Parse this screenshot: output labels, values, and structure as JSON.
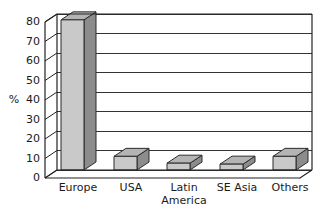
{
  "chart_data": {
    "type": "bar",
    "title": "",
    "subtitle": "",
    "xlabel": "",
    "ylabel": "%",
    "ylim": [
      0,
      80
    ],
    "ytick_step": 10,
    "yticks": [
      0,
      10,
      20,
      30,
      40,
      50,
      60,
      70,
      80
    ],
    "ytick_labels": [
      "0",
      "10",
      "20",
      "30",
      "40",
      "50",
      "60",
      "70",
      "80"
    ],
    "categories": [
      "Europe",
      "USA",
      "Latin America",
      "SE Asia",
      "Others"
    ],
    "category_label_lines": [
      [
        "Europe"
      ],
      [
        "USA"
      ],
      [
        "Latin",
        "America"
      ],
      [
        "SE",
        "Asia"
      ],
      [
        "Others"
      ]
    ],
    "values": [
      77,
      7,
      3.5,
      3,
      7
    ],
    "grid": true,
    "grid_axis": "y",
    "legend": false,
    "legend_position": "none",
    "style": "3d-column",
    "annotations": []
  },
  "colors": {
    "bar_front": "#c9c9c9",
    "bar_top": "#b4b4b4",
    "bar_side": "#8c8c8c",
    "bar_outline": "#2b2b2b",
    "grid": "#333333",
    "frame": "#222222",
    "background": "#ffffff",
    "text": "#1a1a1a"
  },
  "axis": {
    "unit_label": "%",
    "unit_label_value_position": 40
  }
}
